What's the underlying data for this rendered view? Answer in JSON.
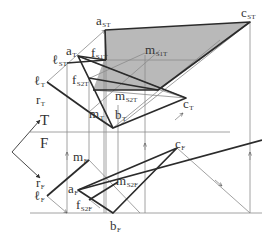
{
  "colors": {
    "thin_line": "#8a8a8a",
    "thick_line": "#2b2b2b",
    "shade": "#b9b9b9",
    "text": "#333333",
    "background": "#ffffff"
  },
  "fold_line": {
    "upper_label": "T",
    "lower_label": "F"
  },
  "labels": {
    "a_ST": {
      "base": "a",
      "sub": "ST"
    },
    "c_ST": {
      "base": "c",
      "sub": "ST"
    },
    "l_ST": {
      "base": "ℓ",
      "sub": "ST"
    },
    "a_T": {
      "base": "a",
      "sub": "T"
    },
    "f_S1T": {
      "base": "f",
      "sub": "S1T"
    },
    "m_S1T": {
      "base": "m",
      "sub": "S1T"
    },
    "l_T": {
      "base": "ℓ",
      "sub": "T"
    },
    "f_S2T": {
      "base": "f",
      "sub": "S2T"
    },
    "r_T": {
      "base": "r",
      "sub": "T"
    },
    "m_S2T": {
      "base": "m",
      "sub": "S2T"
    },
    "c_T": {
      "base": "c",
      "sub": "T"
    },
    "m_T": {
      "base": "m",
      "sub": "T"
    },
    "b_T": {
      "base": "b",
      "sub": "T"
    },
    "r_F": {
      "base": "r",
      "sub": "F"
    },
    "m_F": {
      "base": "m",
      "sub": "F"
    },
    "c_F": {
      "base": "c",
      "sub": "F"
    },
    "a_F": {
      "base": "a",
      "sub": "F"
    },
    "m_S2F": {
      "base": "m",
      "sub": "S2F"
    },
    "l_F": {
      "base": "ℓ",
      "sub": "F"
    },
    "f_S2F": {
      "base": "f",
      "sub": "S2F"
    },
    "b_F": {
      "base": "b",
      "sub": "F"
    }
  }
}
